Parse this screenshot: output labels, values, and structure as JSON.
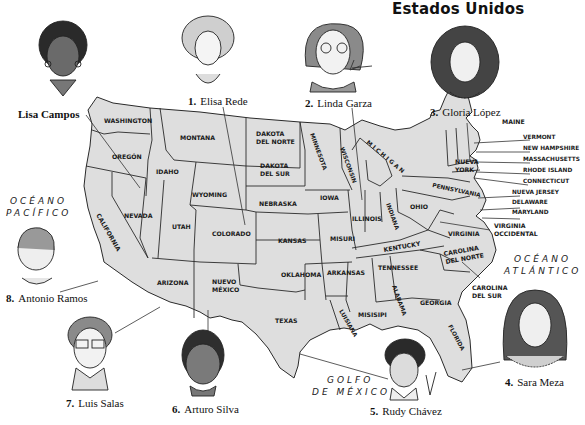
{
  "title": "Estados Unidos",
  "oceans": {
    "pacific": [
      "OCÉANO",
      "PACÍFICO"
    ],
    "atlantic": [
      "OCÉANO",
      "ATLÁNTICO"
    ],
    "gulf": [
      "GOLFO",
      "DE MÉXICO"
    ]
  },
  "people": [
    {
      "number": "",
      "name": "Lisa Campos"
    },
    {
      "number": "1.",
      "name": "Elisa Rede"
    },
    {
      "number": "2.",
      "name": "Linda Garza"
    },
    {
      "number": "3.",
      "name": "Gloria López"
    },
    {
      "number": "4.",
      "name": "Sara Meza"
    },
    {
      "number": "5.",
      "name": "Rudy Chávez"
    },
    {
      "number": "6.",
      "name": "Arturo Silva"
    },
    {
      "number": "7.",
      "name": "Luis Salas"
    },
    {
      "number": "8.",
      "name": "Antonio Ramos"
    }
  ],
  "states": {
    "washington": "WASHINGTON",
    "oregon": "OREGÓN",
    "california": "CALIFORNIA",
    "idaho": "IDAHO",
    "nevada": "NEVADA",
    "montana": "MONTANA",
    "wyoming": "WYOMING",
    "utah": "UTAH",
    "arizona": "ARIZONA",
    "colorado": "COLORADO",
    "nuevo_mexico": [
      "NUEVO",
      "MÉXICO"
    ],
    "dakota_norte": [
      "DAKOTA",
      "DEL NORTE"
    ],
    "dakota_sur": [
      "DAKOTA",
      "DEL SUR"
    ],
    "nebraska": "NEBRASKA",
    "kansas": "KANSAS",
    "oklahoma": "OKLAHOMA",
    "texas": "TEXAS",
    "minnesota": "MINNESOTA",
    "iowa": "IOWA",
    "misuri": "MISURI",
    "arkansas": "ARKANSAS",
    "luisiana": "LUISIANA",
    "wisconsin": "WISCONSIN",
    "illinois": "ILLINOIS",
    "michigan": "M I C H I G A N",
    "indiana": "INDIANA",
    "ohio": "OHIO",
    "kentucky": "KENTUCKY",
    "tennessee": "TENNESSEE",
    "misisipi": "MISISIPI",
    "alabama": "ALABAMA",
    "georgia": "GEORGIA",
    "florida": "FLORIDA",
    "carolina_sur": [
      "CAROLINA",
      "DEL SUR"
    ],
    "carolina_norte": [
      "CAROLINA",
      "DEL NORTE"
    ],
    "virginia": "VIRGINIA",
    "virginia_occidental": [
      "VIRGINIA",
      "OCCIDENTAL"
    ],
    "pennsylvania": "PENNSYLVANIA",
    "nueva_york": [
      "NUEVA",
      "YORK"
    ],
    "maine": "MAINE",
    "vermont": "VERMONT",
    "new_hampshire": "NEW HAMPSHIRE",
    "massachusetts": "MASSACHUSETTS",
    "rhode_island": "RHODE ISLAND",
    "connecticut": "CONNECTICUT",
    "nueva_jersey": "NUEVA JERSEY",
    "delaware": "DELAWARE",
    "maryland": "MARYLAND"
  },
  "colors": {
    "land": "#dcdcdc",
    "land_alt": "#e8e8e8",
    "border": "#2a2a2a",
    "background": "#ffffff"
  }
}
